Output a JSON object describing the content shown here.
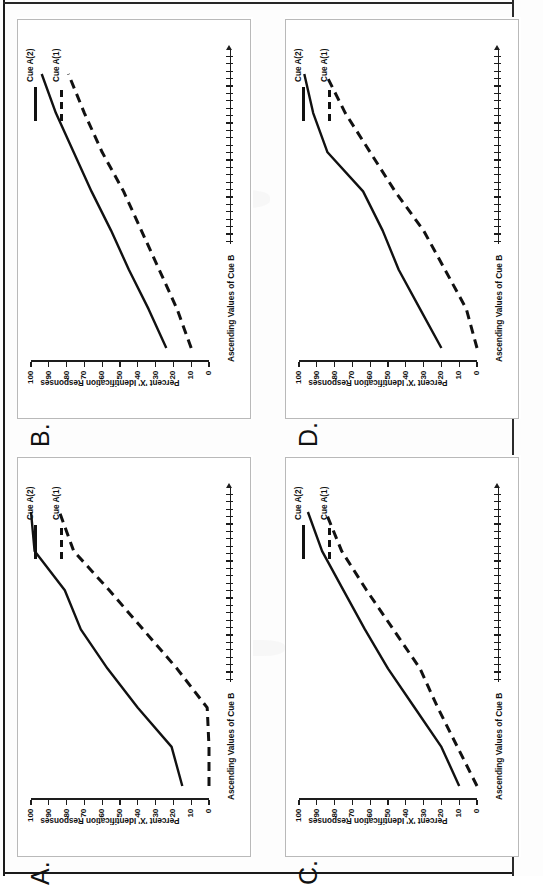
{
  "figure": {
    "panel_count": 4,
    "axis": {
      "y_title": "Percent 'X' Identification Responses",
      "x_title": "Ascending Values of Cue B",
      "y_ticks": [
        "100",
        "90",
        "80",
        "70",
        "60",
        "50",
        "40",
        "30",
        "20",
        "10",
        "0"
      ],
      "y_min": 0,
      "y_max": 100
    },
    "legend": {
      "entries": [
        {
          "label": "Cue A(2)",
          "style": "solid",
          "color": "#111111"
        },
        {
          "label": "Cue A(1)",
          "style": "dashed",
          "color": "#111111"
        }
      ]
    }
  },
  "panels": [
    {
      "id": "A",
      "letter": "A.",
      "position": "bottom-left"
    },
    {
      "id": "B",
      "letter": "B.",
      "position": "top-left"
    },
    {
      "id": "C",
      "letter": "C.",
      "position": "bottom-right"
    },
    {
      "id": "D",
      "letter": "D.",
      "position": "top-right"
    }
  ],
  "chart_data": [
    {
      "panel": "A",
      "type": "line",
      "title": "A.",
      "xlabel": "Ascending Values of Cue B",
      "ylabel": "Percent 'X' Identification Responses",
      "ylim": [
        0,
        100
      ],
      "grid": false,
      "legend_position": "top-right",
      "x": [
        1,
        2,
        3,
        4,
        5,
        6,
        7,
        8
      ],
      "series": [
        {
          "name": "Cue A(2)",
          "style": "solid",
          "values": [
            15,
            21,
            40,
            57,
            72,
            81,
            98,
            100
          ]
        },
        {
          "name": "Cue A(1)",
          "style": "dashed",
          "values": [
            0,
            0,
            1,
            18,
            37,
            56,
            76,
            84
          ]
        }
      ]
    },
    {
      "panel": "B",
      "type": "line",
      "title": "B.",
      "xlabel": "Ascending Values of Cue B",
      "ylabel": "Percent 'X' Identification Responses",
      "ylim": [
        0,
        100
      ],
      "grid": false,
      "legend_position": "top-right",
      "x": [
        1,
        2,
        3,
        4,
        5,
        6,
        7,
        8
      ],
      "series": [
        {
          "name": "Cue A(2)",
          "style": "solid",
          "values": [
            24,
            34,
            45,
            55,
            66,
            76,
            86,
            94
          ]
        },
        {
          "name": "Cue A(1)",
          "style": "dashed",
          "values": [
            10,
            18,
            28,
            38,
            48,
            60,
            70,
            79
          ]
        }
      ]
    },
    {
      "panel": "C",
      "type": "line",
      "title": "C.",
      "xlabel": "Ascending Values of Cue B",
      "ylabel": "Percent 'X' Identification Responses",
      "ylim": [
        0,
        100
      ],
      "grid": false,
      "legend_position": "top-right",
      "x": [
        1,
        2,
        3,
        4,
        5,
        6,
        7,
        8
      ],
      "series": [
        {
          "name": "Cue A(2)",
          "style": "solid",
          "values": [
            10,
            20,
            35,
            50,
            63,
            75,
            87,
            95
          ]
        },
        {
          "name": "Cue A(1)",
          "style": "dashed",
          "values": [
            0,
            11,
            22,
            32,
            47,
            62,
            76,
            85
          ]
        }
      ]
    },
    {
      "panel": "D",
      "type": "line",
      "title": "D.",
      "xlabel": "Ascending Values of Cue B",
      "ylabel": "Percent 'X' Identification Responses",
      "ylim": [
        0,
        100
      ],
      "grid": false,
      "legend_position": "top-right",
      "x": [
        1,
        2,
        3,
        4,
        5,
        6,
        7,
        8
      ],
      "series": [
        {
          "name": "Cue A(2)",
          "style": "solid",
          "values": [
            20,
            32,
            44,
            53,
            64,
            84,
            92,
            97
          ]
        },
        {
          "name": "Cue A(1)",
          "style": "dashed",
          "values": [
            0,
            6,
            18,
            30,
            46,
            60,
            74,
            85
          ]
        }
      ]
    }
  ]
}
